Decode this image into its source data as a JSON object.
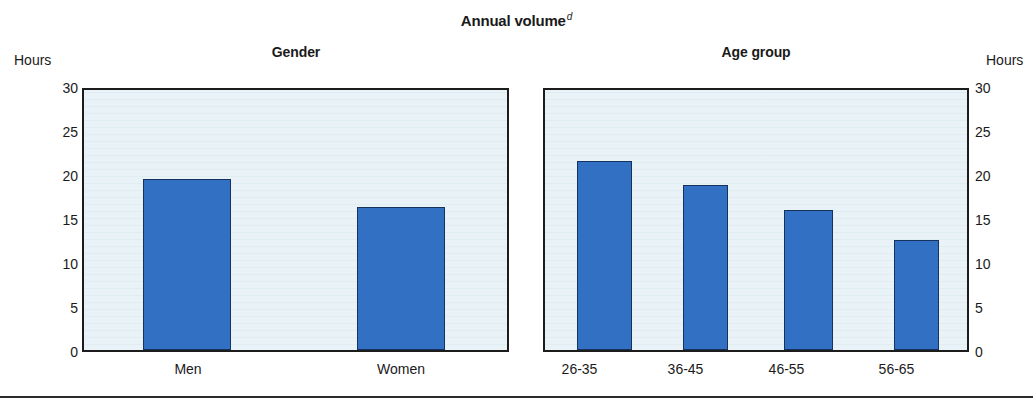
{
  "figure": {
    "title": "Annual volume",
    "title_superscript": "d"
  },
  "chart_data": [
    {
      "type": "bar",
      "title": "Gender",
      "categories": [
        "Men",
        "Women"
      ],
      "values": [
        19.4,
        16.2
      ],
      "xlabel": "",
      "ylabel": "Hours",
      "ylim": [
        0,
        30
      ],
      "yticks": [
        0,
        5,
        10,
        15,
        20,
        25,
        30
      ],
      "ytick_labels": [
        "0",
        "5",
        "10",
        "15",
        "20",
        "25",
        "30"
      ],
      "grid": false,
      "legend": "none",
      "bar_color": "#3270c4",
      "plot_background": "#e9f3f7",
      "axis_caption_position": "left"
    },
    {
      "type": "bar",
      "title": "Age group",
      "categories": [
        "26-35",
        "36-45",
        "46-55",
        "56-65"
      ],
      "values": [
        21.5,
        18.8,
        15.9,
        12.5
      ],
      "xlabel": "",
      "ylabel": "Hours",
      "ylim": [
        0,
        30
      ],
      "yticks": [
        0,
        5,
        10,
        15,
        20,
        25,
        30
      ],
      "ytick_labels": [
        "0",
        "5",
        "10",
        "15",
        "20",
        "25",
        "30"
      ],
      "grid": false,
      "legend": "none",
      "bar_color": "#3270c4",
      "plot_background": "#e9f3f7",
      "axis_caption_position": "right"
    }
  ]
}
